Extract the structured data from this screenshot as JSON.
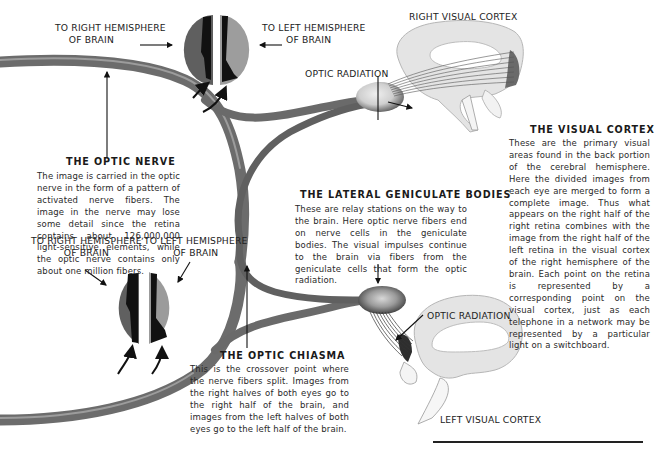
{
  "diagram": {
    "type": "anatomical illustration",
    "colors": {
      "nerve": "#6e6e6e",
      "nerve_highlight": "#9a9a9a",
      "retina_dark": "#5e5e5e",
      "retina_light": "#9b9b9b",
      "image_black": "#111111",
      "brain": "#e3e3e3",
      "brain_outline": "#b8b8b8",
      "cortex_shade": "#6a6a6a",
      "geniculate": "#d8d8d8"
    }
  },
  "labels": {
    "top_eye": {
      "right_hemisphere": [
        "TO RIGHT HEMISPHERE",
        "OF BRAIN"
      ],
      "left_hemisphere": [
        "TO LEFT HEMISPHERE",
        "OF BRAIN"
      ]
    },
    "bottom_eye": {
      "right_hemisphere": [
        "TO RIGHT HEMISPHERE",
        "OF BRAIN"
      ],
      "left_hemisphere": [
        "TO LEFT HEMISPHERE",
        "OF BRAIN"
      ]
    },
    "right_visual_cortex": "RIGHT VISUAL CORTEX",
    "left_visual_cortex": "LEFT VISUAL CORTEX",
    "optic_radiation_top": "OPTIC RADIATION",
    "optic_radiation_bottom": "OPTIC RADIATION"
  },
  "sections": {
    "optic_nerve": {
      "title": "THE OPTIC NERVE",
      "text": "The image is carried in the optic nerve in the form of a pattern of activated nerve fibers. The image in the nerve may lose some detail since the retina contains about 126,000,000 light-sensitive elements, while the optic nerve contains only about one million fibers."
    },
    "lateral_geniculate": {
      "title": "THE LATERAL GENICULATE BODIES",
      "text": "These are relay stations on the way to the brain. Here optic nerve fibers end on nerve cells in the geniculate bodies. The visual impulses continue to the brain via fibers from the geniculate cells that form the optic radiation."
    },
    "visual_cortex": {
      "title": "THE VISUAL CORTEX",
      "text": "These are the primary visual areas found in the back portion of the cerebral hemisphere. Here the divided images from each eye are merged to form a complete image. Thus what appears on the right half of the right retina combines with the image from the right half of the left retina in the visual cortex of the right hemisphere of the brain. Each point on the retina is represented by a corresponding point on the visual cortex, just as each telephone in a network may be represented by a particular light on a switchboard."
    },
    "optic_chiasma": {
      "title": "THE OPTIC CHIASMA",
      "text": "This is the crossover point where the nerve fibers split. Images from the right halves of both eyes go to the right half of the brain, and images from the left halves of both eyes go to the left half of the brain."
    }
  }
}
